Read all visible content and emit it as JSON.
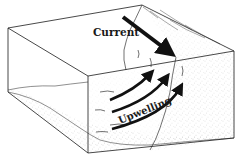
{
  "diagram": {
    "type": "block-diagram",
    "labels": {
      "current": "Current",
      "upwelling": "Upwelling"
    },
    "colors": {
      "ink": "#1a1a1a",
      "arrow": "#111111",
      "stipple": "#8a8a8a",
      "background": "#ffffff"
    },
    "elements": [
      {
        "name": "current-arrow",
        "description": "large black arrow pointing down-right along the water surface toward the slope"
      },
      {
        "name": "upwelling-arrows",
        "count": 3,
        "description": "three curved black arrows rising up the continental slope"
      },
      {
        "name": "sediment-block",
        "description": "stippled 3D cross-section block of seafloor and slope"
      }
    ]
  }
}
